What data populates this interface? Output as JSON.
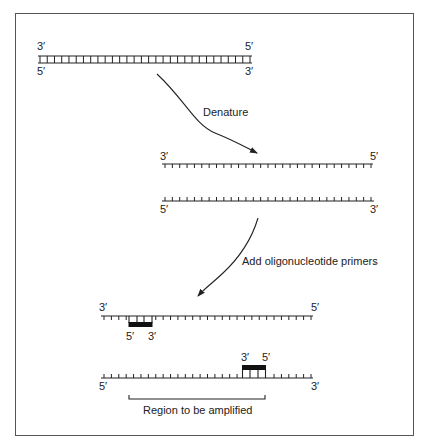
{
  "figure": {
    "steps": [
      {
        "label": "Denature"
      },
      {
        "label": "Add oligonucleotide primers"
      }
    ],
    "double_strand": {
      "top_left": "3′",
      "top_right": "5′",
      "bottom_left": "5′",
      "bottom_right": "3′",
      "rungs": 30
    },
    "separated_strands": [
      {
        "left": "3′",
        "right": "5′",
        "ticks": 29
      },
      {
        "left": "5′",
        "right": "3′",
        "ticks": 29
      }
    ],
    "annealed_strands": [
      {
        "left": "3′",
        "right": "5′",
        "primer_left": "5′",
        "primer_right": "3′"
      },
      {
        "left": "5′",
        "right": "3′",
        "primer_left": "3′",
        "primer_right": "5′"
      }
    ],
    "region_label": "Region to be amplified"
  },
  "colors": {
    "ink": "#222222",
    "frame": "#555555",
    "background": "#ffffff"
  }
}
